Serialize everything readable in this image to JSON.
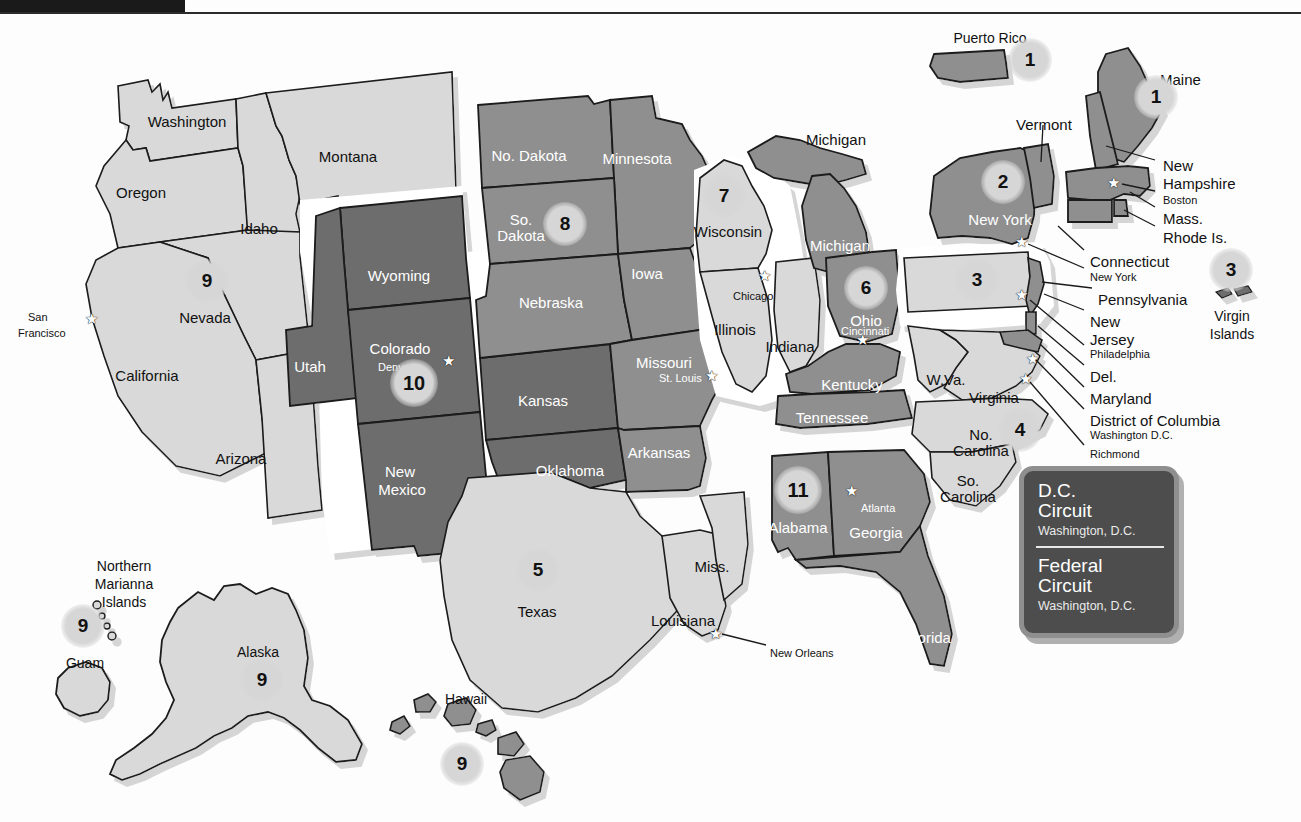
{
  "document": {
    "title": "United States Courts of Appeals — Geographic Boundaries",
    "header_bar": "",
    "background": "#fdfdfd"
  },
  "palette": {
    "light_gray": "#d9d9d9",
    "mid_gray": "#8f8f8f",
    "dark_gray": "#6d6d6d",
    "outline": "#1a1a1a",
    "badge_fill": "#d6d6d6",
    "legend_fill": "#4d4d4d",
    "legend_border": "#8f8f8f",
    "white": "#ffffff"
  },
  "legend": {
    "dc": {
      "line1": "D.C.",
      "line2": "Circuit",
      "city": "Washington, D.C."
    },
    "federal": {
      "line1": "Federal",
      "line2": "Circuit",
      "city": "Washington, D.C."
    }
  },
  "circuits": [
    {
      "number": "1",
      "x": 1030,
      "y": 60,
      "size": "b1",
      "region": "Puerto Rico"
    },
    {
      "number": "1",
      "x": 1156,
      "y": 97,
      "size": "b1",
      "region": "Maine / New England"
    },
    {
      "number": "2",
      "x": 1003,
      "y": 182,
      "size": "b1",
      "region": "New York"
    },
    {
      "number": "3",
      "x": 1231,
      "y": 270,
      "size": "b1",
      "region": "Virgin Islands"
    },
    {
      "number": "3",
      "x": 977,
      "y": 280,
      "size": "b1",
      "region": "Pennsylvania / N.J. / Del."
    },
    {
      "number": "4",
      "x": 1020,
      "y": 430,
      "size": "b1",
      "region": "Virginia / Carolinas"
    },
    {
      "number": "5",
      "x": 538,
      "y": 570,
      "size": "b1",
      "region": "Texas / Louisiana / Miss."
    },
    {
      "number": "6",
      "x": 866,
      "y": 288,
      "size": "b1",
      "region": "Ohio / Michigan / Kentucky / Tennessee"
    },
    {
      "number": "7",
      "x": 724,
      "y": 196,
      "size": "b1",
      "region": "Wisconsin / Illinois / Indiana"
    },
    {
      "number": "8",
      "x": 565,
      "y": 224,
      "size": "b1",
      "region": "Dakotas / Nebraska / Missouri / Arkansas"
    },
    {
      "number": "9",
      "x": 207,
      "y": 281,
      "size": "b1",
      "region": "Nevada / California / Pacific"
    },
    {
      "number": "9",
      "x": 83,
      "y": 626,
      "size": "b1",
      "region": "Guam / N. Marianas"
    },
    {
      "number": "9",
      "x": 262,
      "y": 680,
      "size": "b1",
      "region": "Alaska"
    },
    {
      "number": "9",
      "x": 462,
      "y": 764,
      "size": "b1",
      "region": "Hawaii"
    },
    {
      "number": "10",
      "x": 414,
      "y": 383,
      "size": "b2",
      "region": "Colorado / Utah / Wyoming / Kansas / Oklahoma / N.M."
    },
    {
      "number": "11",
      "x": 798,
      "y": 490,
      "size": "b2",
      "region": "Alabama / Georgia / Florida"
    }
  ],
  "state_labels": [
    {
      "text": "Washington",
      "x": 187,
      "y": 113,
      "tone": "dark"
    },
    {
      "text": "Montana",
      "x": 348,
      "y": 148,
      "tone": "dark"
    },
    {
      "text": "Oregon",
      "x": 141,
      "y": 184,
      "tone": "dark"
    },
    {
      "text": "Idaho",
      "x": 259,
      "y": 220,
      "tone": "dark"
    },
    {
      "text": "Nevada",
      "x": 205,
      "y": 309,
      "tone": "dark"
    },
    {
      "text": "California",
      "x": 147,
      "y": 367,
      "tone": "dark"
    },
    {
      "text": "Arizona",
      "x": 241,
      "y": 450,
      "tone": "dark"
    },
    {
      "text": "Utah",
      "x": 310,
      "y": 358,
      "tone": "light"
    },
    {
      "text": "Wyoming",
      "x": 399,
      "y": 267,
      "tone": "light"
    },
    {
      "text": "Colorado",
      "x": 400,
      "y": 340,
      "tone": "light"
    },
    {
      "text": "New",
      "x": 400,
      "y": 463,
      "tone": "light"
    },
    {
      "text": "Mexico",
      "x": 402,
      "y": 481,
      "tone": "light"
    },
    {
      "text": "No. Dakota",
      "x": 529,
      "y": 147,
      "tone": "light"
    },
    {
      "text": "Minnesota",
      "x": 637,
      "y": 150,
      "tone": "light"
    },
    {
      "text": "So.",
      "x": 521,
      "y": 211,
      "tone": "light"
    },
    {
      "text": "Dakota",
      "x": 521,
      "y": 227,
      "tone": "light"
    },
    {
      "text": "Nebraska",
      "x": 551,
      "y": 294,
      "tone": "light"
    },
    {
      "text": "Iowa",
      "x": 647,
      "y": 265,
      "tone": "light"
    },
    {
      "text": "Kansas",
      "x": 543,
      "y": 392,
      "tone": "light"
    },
    {
      "text": "Missouri",
      "x": 664,
      "y": 354,
      "tone": "light"
    },
    {
      "text": "Oklahoma",
      "x": 570,
      "y": 462,
      "tone": "light"
    },
    {
      "text": "Arkansas",
      "x": 659,
      "y": 444,
      "tone": "light"
    },
    {
      "text": "Texas",
      "x": 537,
      "y": 603,
      "tone": "dark"
    },
    {
      "text": "Louisiana",
      "x": 683,
      "y": 612,
      "tone": "dark"
    },
    {
      "text": "Miss.",
      "x": 712,
      "y": 558,
      "tone": "dark"
    },
    {
      "text": "Wisconsin",
      "x": 728,
      "y": 223,
      "tone": "dark"
    },
    {
      "text": "Illinois",
      "x": 735,
      "y": 321,
      "tone": "dark"
    },
    {
      "text": "Indiana",
      "x": 790,
      "y": 338,
      "tone": "dark"
    },
    {
      "text": "Michigan",
      "x": 836,
      "y": 131,
      "tone": "dark"
    },
    {
      "text": "Michigan",
      "x": 840,
      "y": 237,
      "tone": "light"
    },
    {
      "text": "Ohio",
      "x": 866,
      "y": 312,
      "tone": "light"
    },
    {
      "text": "Kentucky",
      "x": 852,
      "y": 376,
      "tone": "light"
    },
    {
      "text": "Tennessee",
      "x": 832,
      "y": 409,
      "tone": "light"
    },
    {
      "text": "Alabama",
      "x": 798,
      "y": 519,
      "tone": "light"
    },
    {
      "text": "Georgia",
      "x": 876,
      "y": 524,
      "tone": "light"
    },
    {
      "text": "Florida",
      "x": 928,
      "y": 629,
      "tone": "light"
    },
    {
      "text": "W.Va.",
      "x": 946,
      "y": 371,
      "tone": "dark"
    },
    {
      "text": "Virginia",
      "x": 994,
      "y": 389,
      "tone": "dark"
    },
    {
      "text": "No.",
      "x": 981,
      "y": 426,
      "tone": "dark"
    },
    {
      "text": "Carolina",
      "x": 981,
      "y": 442,
      "tone": "dark"
    },
    {
      "text": "So.",
      "x": 968,
      "y": 472,
      "tone": "dark"
    },
    {
      "text": "Carolina",
      "x": 968,
      "y": 488,
      "tone": "dark"
    },
    {
      "text": "New York",
      "x": 1000,
      "y": 211,
      "tone": "light"
    }
  ],
  "callout_labels": [
    {
      "text": "Maine",
      "x": 1160,
      "y": 71,
      "size": "state"
    },
    {
      "text": "Vermont",
      "x": 1016,
      "y": 116,
      "size": "state"
    },
    {
      "text": "New",
      "x": 1163,
      "y": 157,
      "size": "state"
    },
    {
      "text": "Hampshire",
      "x": 1163,
      "y": 175,
      "size": "state"
    },
    {
      "text": "Boston",
      "x": 1163,
      "y": 194,
      "size": "city"
    },
    {
      "text": "Mass.",
      "x": 1163,
      "y": 210,
      "size": "state"
    },
    {
      "text": "Rhode Is.",
      "x": 1163,
      "y": 229,
      "size": "state"
    },
    {
      "text": "Connecticut",
      "x": 1090,
      "y": 253,
      "size": "state"
    },
    {
      "text": "New York",
      "x": 1090,
      "y": 271,
      "size": "city"
    },
    {
      "text": "Pennsylvania",
      "x": 1098,
      "y": 291,
      "size": "state"
    },
    {
      "text": "New",
      "x": 1090,
      "y": 313,
      "size": "state"
    },
    {
      "text": "Jersey",
      "x": 1090,
      "y": 331,
      "size": "state"
    },
    {
      "text": "Philadelphia",
      "x": 1090,
      "y": 348,
      "size": "city"
    },
    {
      "text": "Del.",
      "x": 1090,
      "y": 368,
      "size": "state"
    },
    {
      "text": "Maryland",
      "x": 1090,
      "y": 390,
      "size": "state"
    },
    {
      "text": "District of Columbia",
      "x": 1090,
      "y": 412,
      "size": "state"
    },
    {
      "text": "Washington D.C.",
      "x": 1090,
      "y": 429,
      "size": "city"
    },
    {
      "text": "Richmond",
      "x": 1090,
      "y": 448,
      "size": "city"
    }
  ],
  "territory_labels": [
    {
      "text": "Puerto Rico",
      "x": 990,
      "y": 30,
      "align": "center"
    },
    {
      "text": "Virgin",
      "x": 1232,
      "y": 308,
      "align": "center"
    },
    {
      "text": "Islands",
      "x": 1232,
      "y": 326,
      "align": "center"
    },
    {
      "text": "Northern",
      "x": 124,
      "y": 558,
      "align": "center"
    },
    {
      "text": "Marianna",
      "x": 124,
      "y": 576,
      "align": "center"
    },
    {
      "text": "Islands",
      "x": 124,
      "y": 594,
      "align": "center"
    },
    {
      "text": "Guam",
      "x": 85,
      "y": 655,
      "align": "center"
    },
    {
      "text": "Alaska",
      "x": 258,
      "y": 644,
      "align": "center"
    },
    {
      "text": "Hawaii",
      "x": 466,
      "y": 691,
      "align": "center"
    }
  ],
  "city_labels": [
    {
      "text": "San",
      "x": 28,
      "y": 311,
      "tone": "dark"
    },
    {
      "text": "Francisco",
      "x": 18,
      "y": 327,
      "tone": "dark"
    },
    {
      "text": "Denver",
      "x": 378,
      "y": 361,
      "tone": "light"
    },
    {
      "text": "St. Louis",
      "x": 659,
      "y": 372,
      "tone": "light"
    },
    {
      "text": "Chicago",
      "x": 733,
      "y": 290,
      "tone": "dark"
    },
    {
      "text": "Cincinnati",
      "x": 841,
      "y": 325,
      "tone": "light"
    },
    {
      "text": "Atlanta",
      "x": 861,
      "y": 502,
      "tone": "light"
    },
    {
      "text": "New Orleans",
      "x": 770,
      "y": 647,
      "tone": "dark"
    }
  ],
  "star_markers": [
    {
      "name": "san-francisco-star",
      "x": 91,
      "y": 318
    },
    {
      "name": "denver-star",
      "x": 448,
      "y": 360
    },
    {
      "name": "st-louis-star",
      "x": 711,
      "y": 375
    },
    {
      "name": "chicago-star",
      "x": 764,
      "y": 275
    },
    {
      "name": "cincinnati-star",
      "x": 862,
      "y": 339
    },
    {
      "name": "atlanta-star",
      "x": 851,
      "y": 490
    },
    {
      "name": "new-orleans-star",
      "x": 715,
      "y": 633
    },
    {
      "name": "boston-star",
      "x": 1113,
      "y": 182
    },
    {
      "name": "new-york-star",
      "x": 1021,
      "y": 241
    },
    {
      "name": "philadelphia-star",
      "x": 1021,
      "y": 294
    },
    {
      "name": "richmond-star",
      "x": 1025,
      "y": 378
    },
    {
      "name": "washington-dc-star",
      "x": 1032,
      "y": 358
    }
  ]
}
